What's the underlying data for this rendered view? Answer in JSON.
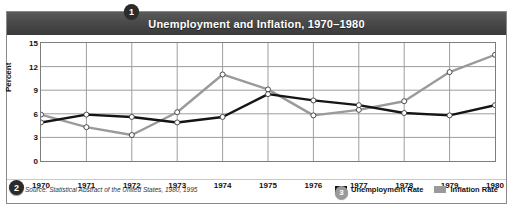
{
  "figure": {
    "title": "Unemployment and Inflation, 1970–1980",
    "source_note": "Source: Statistical Abstract of the United States, 1980, 1995",
    "callouts": [
      {
        "number": "1",
        "name": "title-callout"
      },
      {
        "number": "2",
        "name": "source-callout"
      },
      {
        "number": "3",
        "name": "legend-callout"
      }
    ]
  },
  "colors": {
    "unemployment": "#151515",
    "inflation": "#9a9a9a",
    "title_bar": "#434343",
    "grid": "#9d9d9d",
    "frame": "#7d7d7d",
    "marker_fill": "#ffffff"
  },
  "chart_data": {
    "type": "line",
    "title": "Unemployment and Inflation, 1970–1980",
    "xlabel": "",
    "ylabel": "Percent",
    "categories": [
      "1970",
      "1971",
      "1972",
      "1973",
      "1974",
      "1975",
      "1976",
      "1977",
      "1978",
      "1979",
      "1980"
    ],
    "x": [
      1970,
      1971,
      1972,
      1973,
      1974,
      1975,
      1976,
      1977,
      1978,
      1979,
      1980
    ],
    "ylim": [
      0,
      15
    ],
    "yticks": [
      0,
      3,
      6,
      9,
      12,
      15
    ],
    "ytick_labels": [
      "0",
      "3",
      "6",
      "9",
      "12",
      "15"
    ],
    "grid": true,
    "legend_position": "bottom-right",
    "series": [
      {
        "name": "Unemployment Rate",
        "color": "#151515",
        "values": [
          4.9,
          5.9,
          5.6,
          4.9,
          5.6,
          8.5,
          7.7,
          7.1,
          6.1,
          5.8,
          7.1
        ]
      },
      {
        "name": "Inflation Rate",
        "color": "#9a9a9a",
        "values": [
          5.9,
          4.3,
          3.3,
          6.2,
          11.0,
          9.1,
          5.8,
          6.5,
          7.6,
          11.3,
          13.5
        ]
      }
    ]
  },
  "legend": {
    "entries": [
      {
        "label": "Unemployment Rate",
        "color": "#151515"
      },
      {
        "label": "Inflation Rate",
        "color": "#9a9a9a"
      }
    ]
  }
}
